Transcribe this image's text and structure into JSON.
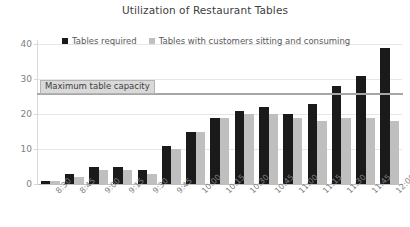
{
  "chart_data": {
    "type": "bar",
    "title": "Utilization of Restaurant Tables",
    "xlabel": "",
    "ylabel": "",
    "ylim": [
      0,
      40
    ],
    "yticks": [
      0,
      10,
      20,
      30,
      40
    ],
    "grid": true,
    "legend_position": "top-left",
    "categories": [
      "8:30",
      "8:45",
      "9:00",
      "9:15",
      "9:30",
      "9:45",
      "10:00",
      "10:15",
      "10:30",
      "10:45",
      "11:00",
      "11:15",
      "11:30",
      "11:45",
      "12:00"
    ],
    "series": [
      {
        "name": "Tables required",
        "color": "#1a1a1a",
        "values": [
          1,
          3,
          5,
          5,
          4,
          11,
          15,
          19,
          21,
          22,
          20,
          23,
          28,
          31,
          39
        ]
      },
      {
        "name": "Tables with customers sitting and consuming",
        "color": "#bfbfbf",
        "values": [
          1,
          2,
          4,
          4,
          3,
          10,
          15,
          19,
          20,
          20,
          19,
          18,
          19,
          19,
          18
        ]
      }
    ],
    "annotations": [
      {
        "label": "Maximum table capacity",
        "value": 26,
        "type": "horizontal-line",
        "color": "#a6a6a6"
      }
    ]
  }
}
